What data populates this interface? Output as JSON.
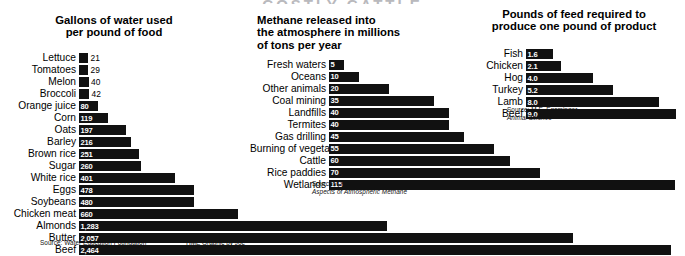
{
  "masthead": "COSTLY CATTLE",
  "credit": "TIME Graphic by Joe Lertola",
  "chart_data": [
    {
      "id": "water",
      "type": "bar",
      "orientation": "horizontal",
      "title": "Gallons of water used\nper pound of food",
      "xlabel": "",
      "ylabel": "",
      "source": "Source: Water Education Foundation",
      "grid": false,
      "legend": "none",
      "xlim": [
        0,
        2464
      ],
      "categories": [
        "Lettuce",
        "Tomatoes",
        "Melon",
        "Broccoli",
        "Orange juice",
        "Corn",
        "Oats",
        "Barley",
        "Brown rice",
        "Sugar",
        "White rice",
        "Eggs",
        "Soybeans",
        "Chicken meat",
        "Almonds",
        "Butter",
        "Beef"
      ],
      "values": [
        21,
        29,
        40,
        42,
        80,
        119,
        197,
        216,
        251,
        260,
        401,
        478,
        480,
        660,
        1283,
        2057,
        2464
      ],
      "value_labels": [
        "21",
        "29",
        "40",
        "42",
        "80",
        "119",
        "197",
        "216",
        "251",
        "260",
        "401",
        "478",
        "480",
        "660",
        "1,283",
        "2,057",
        "2,464"
      ]
    },
    {
      "id": "methane",
      "type": "bar",
      "orientation": "horizontal",
      "title": "Methane released into\nthe atmosphere in millions\nof tons per year",
      "xlabel": "",
      "ylabel": "",
      "source": "Source: Cicerone & Oremland, ",
      "source_italic": "Biogeochemical Aspects of Atmospheric Methane",
      "grid": false,
      "legend": "none",
      "xlim": [
        0,
        115
      ],
      "categories": [
        "Fresh waters",
        "Oceans",
        "Other animals",
        "Coal mining",
        "Landfills",
        "Termites",
        "Gas drilling",
        "Burning of vegetation",
        "Cattle",
        "Rice paddies",
        "Wetlands"
      ],
      "values": [
        5,
        10,
        20,
        35,
        40,
        40,
        45,
        55,
        60,
        70,
        115
      ],
      "value_labels": [
        "5",
        "10",
        "20",
        "35",
        "40",
        "40",
        "45",
        "55",
        "60",
        "70",
        "115"
      ]
    },
    {
      "id": "feed",
      "type": "bar",
      "orientation": "horizontal",
      "title": "Pounds of feed required to\nproduce one pound of product",
      "xlabel": "",
      "ylabel": "",
      "source": "Source: M.E. Ensminger, ",
      "source_italic": "Animal Science",
      "grid": false,
      "legend": "none",
      "xlim": [
        0,
        9.0
      ],
      "categories": [
        "Fish",
        "Chicken",
        "Hog",
        "Turkey",
        "Lamb",
        "Beef"
      ],
      "values": [
        1.6,
        2.1,
        4.0,
        5.2,
        8.0,
        9.0
      ],
      "value_labels": [
        "1.6",
        "2.1",
        "4.0",
        "5.2",
        "8.0",
        "9.0"
      ]
    }
  ]
}
